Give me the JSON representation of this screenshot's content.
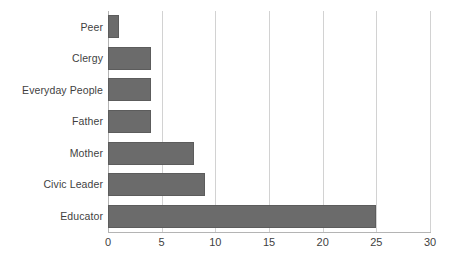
{
  "chart_data": {
    "type": "bar",
    "orientation": "horizontal",
    "title": "",
    "xlabel": "",
    "ylabel": "",
    "categories": [
      "Peer",
      "Clergy",
      "Everyday People",
      "Father",
      "Mother",
      "Civic Leader",
      "Educator"
    ],
    "values": [
      1,
      4,
      4,
      4,
      8,
      9,
      25
    ],
    "xlim": [
      0,
      30
    ],
    "xticks": [
      0,
      5,
      10,
      15,
      20,
      25,
      30
    ],
    "xtick_labels": [
      "0",
      "5",
      "10",
      "15",
      "20",
      "25",
      "30"
    ],
    "grid": "vertical",
    "legend": "none",
    "colors": {
      "bar_fill": "#6b6b6b",
      "bar_border": "#5c5c5c",
      "gridline": "#d2d2d2",
      "axis_line": "#b4b4b4",
      "text": "#3f3f3f",
      "background": "#ffffff"
    }
  }
}
